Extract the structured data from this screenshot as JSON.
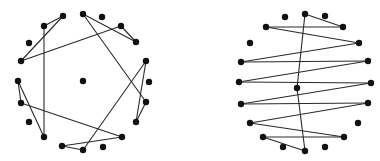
{
  "figure": {
    "colors": {
      "node": "#111111",
      "edge": "#2a2a2a",
      "background": "#ffffff"
    },
    "node_radius": 3.2
  },
  "graphs": [
    {
      "name": "left-graph",
      "nodes": [
        [
          63,
          16
        ],
        [
          44,
          26
        ],
        [
          83,
          14
        ],
        [
          102,
          17
        ],
        [
          121,
          26
        ],
        [
          136,
          42
        ],
        [
          29,
          43
        ],
        [
          21,
          61
        ],
        [
          146,
          61
        ],
        [
          149,
          82
        ],
        [
          83,
          81
        ],
        [
          18,
          81
        ],
        [
          21,
          103
        ],
        [
          146,
          102
        ],
        [
          136,
          122
        ],
        [
          29,
          122
        ],
        [
          44,
          137
        ],
        [
          122,
          137
        ],
        [
          62,
          146
        ],
        [
          83,
          150
        ],
        [
          103,
          147
        ]
      ],
      "edges": [
        [
          [
            63,
            16
          ],
          [
            44,
            26
          ]
        ],
        [
          [
            63,
            16
          ],
          [
            21,
            61
          ]
        ],
        [
          [
            44,
            26
          ],
          [
            44,
            137
          ]
        ],
        [
          [
            21,
            61
          ],
          [
            121,
            26
          ]
        ],
        [
          [
            83,
            14
          ],
          [
            136,
            42
          ]
        ],
        [
          [
            121,
            26
          ],
          [
            136,
            42
          ]
        ],
        [
          [
            83,
            14
          ],
          [
            146,
            102
          ]
        ],
        [
          [
            146,
            61
          ],
          [
            136,
            122
          ]
        ],
        [
          [
            146,
            102
          ],
          [
            136,
            122
          ]
        ],
        [
          [
            146,
            61
          ],
          [
            83,
            150
          ]
        ],
        [
          [
            18,
            81
          ],
          [
            44,
            137
          ]
        ],
        [
          [
            18,
            81
          ],
          [
            21,
            103
          ]
        ],
        [
          [
            21,
            103
          ],
          [
            122,
            137
          ]
        ],
        [
          [
            62,
            146
          ],
          [
            122,
            137
          ]
        ],
        [
          [
            62,
            146
          ],
          [
            83,
            150
          ]
        ]
      ]
    },
    {
      "name": "right-graph",
      "nodes": [
        [
          285,
          17
        ],
        [
          305,
          14
        ],
        [
          325,
          16
        ],
        [
          266,
          27
        ],
        [
          343,
          27
        ],
        [
          250,
          43
        ],
        [
          359,
          43
        ],
        [
          241,
          62
        ],
        [
          368,
          61
        ],
        [
          239,
          82
        ],
        [
          371,
          83
        ],
        [
          297,
          88
        ],
        [
          241,
          104
        ],
        [
          368,
          103
        ],
        [
          250,
          123
        ],
        [
          358,
          123
        ],
        [
          263,
          137
        ],
        [
          344,
          137
        ],
        [
          283,
          147
        ],
        [
          305,
          151
        ],
        [
          325,
          147
        ]
      ],
      "edges": [
        [
          [
            305,
            14
          ],
          [
            343,
            27
          ]
        ],
        [
          [
            266,
            27
          ],
          [
            343,
            27
          ]
        ],
        [
          [
            266,
            27
          ],
          [
            359,
            43
          ]
        ],
        [
          [
            359,
            43
          ],
          [
            241,
            62
          ]
        ],
        [
          [
            241,
            62
          ],
          [
            368,
            61
          ]
        ],
        [
          [
            368,
            61
          ],
          [
            239,
            82
          ]
        ],
        [
          [
            239,
            82
          ],
          [
            371,
            83
          ]
        ],
        [
          [
            371,
            83
          ],
          [
            241,
            104
          ]
        ],
        [
          [
            241,
            104
          ],
          [
            368,
            103
          ]
        ],
        [
          [
            368,
            103
          ],
          [
            250,
            123
          ]
        ],
        [
          [
            250,
            123
          ],
          [
            344,
            137
          ]
        ],
        [
          [
            344,
            137
          ],
          [
            263,
            137
          ]
        ],
        [
          [
            263,
            137
          ],
          [
            305,
            151
          ]
        ],
        [
          [
            305,
            14
          ],
          [
            297,
            88
          ]
        ],
        [
          [
            297,
            88
          ],
          [
            305,
            151
          ]
        ]
      ]
    }
  ]
}
